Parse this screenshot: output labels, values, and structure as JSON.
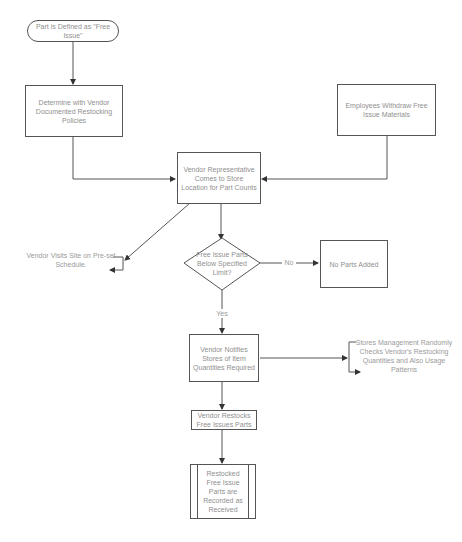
{
  "diagram": {
    "type": "flowchart",
    "nodes": {
      "start": {
        "text": "Part is Defined as \"Free Issue\"",
        "shape": "terminal"
      },
      "determine": {
        "text": "Determine with Vendor Documented Restocking Policies",
        "shape": "process"
      },
      "employees": {
        "text": "Employees Withdraw Free Issue Materials",
        "shape": "process"
      },
      "vendor_comes": {
        "text": "Vendor Representative Comes to Store Location for Part Counts",
        "shape": "process"
      },
      "vendor_visits": {
        "text": "Vendor Visits Site on Pre-set Schedule.",
        "shape": "annotation"
      },
      "decision": {
        "text": "Free Issue Parts Below Specified Limit?",
        "shape": "decision"
      },
      "no_parts": {
        "text": "No Parts Added",
        "shape": "process"
      },
      "notifies": {
        "text": "Vendor Notifies Stores of Item Quantities Required",
        "shape": "process"
      },
      "stores_mgmt": {
        "text": "Stores Management Randomly Checks Vendor's Restocking Quantities and Also Usage Patterns",
        "shape": "annotation"
      },
      "restocks": {
        "text": "Vendor Restocks Free Issues Parts",
        "shape": "process"
      },
      "recorded": {
        "text": "Restocked Free Issue Parts are Recorded as Received",
        "shape": "predefined-process"
      }
    },
    "edge_labels": {
      "no": "No",
      "yes": "Yes"
    },
    "edges": [
      {
        "from": "start",
        "to": "determine"
      },
      {
        "from": "determine",
        "to": "vendor_comes"
      },
      {
        "from": "employees",
        "to": "vendor_comes"
      },
      {
        "from": "vendor_comes",
        "to": "vendor_visits"
      },
      {
        "from": "vendor_comes",
        "to": "decision"
      },
      {
        "from": "decision",
        "to": "no_parts",
        "label": "No"
      },
      {
        "from": "decision",
        "to": "notifies",
        "label": "Yes"
      },
      {
        "from": "notifies",
        "to": "stores_mgmt"
      },
      {
        "from": "notifies",
        "to": "restocks"
      },
      {
        "from": "restocks",
        "to": "recorded"
      }
    ],
    "colors": {
      "line": "#555555",
      "text": "#8f8f8f",
      "background": "#ffffff"
    }
  }
}
